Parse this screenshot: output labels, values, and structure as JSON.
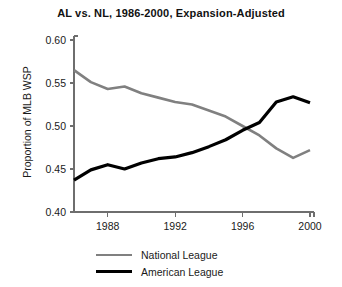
{
  "chart_data": {
    "type": "line",
    "title": "AL vs. NL, 1986-2000, Expansion-Adjusted",
    "xlabel": "",
    "ylabel": "Proportion of MLB WSP",
    "xlim": [
      1986,
      2000
    ],
    "ylim": [
      0.4,
      0.6
    ],
    "yticks": [
      "0.60",
      "0.55",
      "0.50",
      "0.45",
      "0.40"
    ],
    "ytick_values": [
      0.6,
      0.55,
      0.5,
      0.45,
      0.4
    ],
    "xticks": [
      "1988",
      "1992",
      "1996",
      "2000"
    ],
    "xtick_values": [
      1988,
      1992,
      1996,
      2000
    ],
    "grid": false,
    "legend_position": "bottom-left",
    "x": [
      1986,
      1987,
      1988,
      1989,
      1990,
      1991,
      1992,
      1993,
      1994,
      1995,
      1996,
      1997,
      1998,
      1999,
      2000
    ],
    "series": [
      {
        "name": "National League",
        "color": "#808080",
        "values": [
          0.565,
          0.551,
          0.543,
          0.546,
          0.538,
          0.533,
          0.528,
          0.525,
          0.518,
          0.511,
          0.5,
          0.489,
          0.474,
          0.463,
          0.472
        ]
      },
      {
        "name": "American League",
        "color": "#000000",
        "values": [
          0.437,
          0.449,
          0.455,
          0.45,
          0.457,
          0.462,
          0.464,
          0.469,
          0.476,
          0.484,
          0.495,
          0.504,
          0.528,
          0.534,
          0.527
        ]
      }
    ]
  },
  "legend": {
    "items": [
      {
        "label": "National League",
        "color": "#808080",
        "width": "2.6px"
      },
      {
        "label": "American League",
        "color": "#000000",
        "width": "3.4px"
      }
    ]
  },
  "axis_style": {
    "axis_color": "#6e6e6e",
    "background": "#ffffff"
  }
}
